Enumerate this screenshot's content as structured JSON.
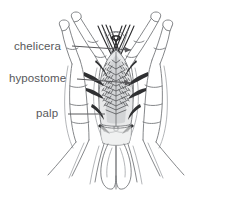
{
  "figure": {
    "background_color": "#ffffff",
    "ink_color": "#6f7175",
    "dark_ink_color": "#2b2b2d",
    "label_color": "#58585b",
    "width": 232,
    "height": 200
  },
  "labels": [
    {
      "id": "chelicera",
      "text": "chelicera",
      "text_x": 14,
      "text_y": 50,
      "leader_from_x": 72,
      "leader_from_y": 46,
      "leader_to_x": 131,
      "leader_to_y": 50,
      "has_arrow": true
    },
    {
      "id": "hypostome",
      "text": "hypostome",
      "text_x": 9,
      "text_y": 82,
      "leader_from_x": 77,
      "leader_from_y": 79,
      "leader_to_x": 131,
      "leader_to_y": 83,
      "has_arrow": true
    },
    {
      "id": "palp",
      "text": "palp",
      "text_x": 36,
      "text_y": 117,
      "leader_from_x": 68,
      "leader_from_y": 114,
      "leader_to_x": 105,
      "leader_to_y": 114,
      "has_arrow": false
    }
  ],
  "structures": [
    {
      "id": "left-palp",
      "name": "left palp"
    },
    {
      "id": "right-palp",
      "name": "right palp"
    },
    {
      "id": "left-chelicera",
      "name": "left chelicera"
    },
    {
      "id": "right-chelicera",
      "name": "right chelicera"
    },
    {
      "id": "hypostome-body",
      "name": "hypostome with denticles"
    },
    {
      "id": "basis-capituli",
      "name": "basis capituli"
    },
    {
      "id": "left-lobe",
      "name": "left ventral lobe"
    },
    {
      "id": "right-lobe",
      "name": "right ventral lobe"
    }
  ]
}
